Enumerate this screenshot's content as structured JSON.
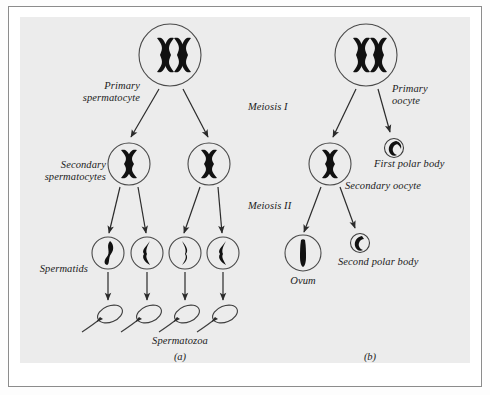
{
  "figure": {
    "kind": "biology-diagram",
    "topic": "Meiosis: spermatogenesis and oogenesis",
    "panels": [
      {
        "tag": "(a)",
        "name": "spermatogenesis"
      },
      {
        "tag": "(b)",
        "name": "oogenesis"
      }
    ],
    "stage_labels": {
      "meiosis_1": "Meiosis I",
      "meiosis_2": "Meiosis II"
    }
  },
  "spermatogenesis": {
    "primary_label_line1": "Primary",
    "primary_label_line2": "spermatocyte",
    "secondary_label_line1": "Secondary",
    "secondary_label_line2": "spermatocytes",
    "spermatids_label": "Spermatids",
    "spermatozoa_label": "Spermatozoa",
    "panel_tag": "(a)",
    "cell_counts": {
      "primary_spermatocyte": 1,
      "secondary_spermatocytes": 2,
      "spermatids": 4,
      "spermatozoa": 4
    }
  },
  "oogenesis": {
    "primary_label_line1": "Primary",
    "primary_label_line2": "oocyte",
    "first_polar_body_label": "First polar body",
    "secondary_oocyte_label": "Secondary oocyte",
    "second_polar_body_label": "Second polar body",
    "ovum_label": "Ovum",
    "panel_tag": "(b)",
    "cell_counts": {
      "primary_oocyte": 1,
      "secondary_oocyte": 1,
      "first_polar_body": 1,
      "ovum": 1,
      "second_polar_body": 1
    }
  },
  "colors": {
    "page": "#ffffff",
    "plate": "#ececec",
    "frame_rule": "#8c8c8c",
    "cell_outline": "#4a4a4a",
    "chromosome": "#111111",
    "arrow": "#2b2b2b",
    "text": "#1b1b1b"
  }
}
